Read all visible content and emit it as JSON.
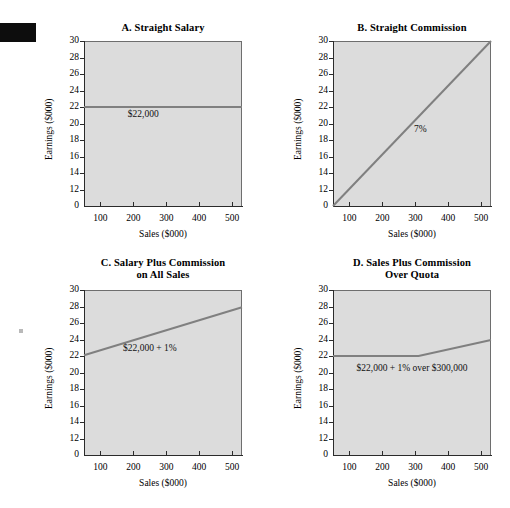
{
  "figure": {
    "background": "#ffffff",
    "plot_fill": "#dcdcdc",
    "line_color": "#808080",
    "axis_color": "#2b2b2b"
  },
  "chart_data": [
    {
      "type": "line",
      "panel": "A",
      "title": "A. Straight Salary",
      "title_line2": "",
      "xlabel": "Sales ($000)",
      "ylabel": "Earnings ($000)",
      "xlim": [
        50,
        530
      ],
      "ylim": [
        10,
        30
      ],
      "xticks": [
        100,
        200,
        300,
        400,
        500
      ],
      "yticks": [
        30,
        28,
        26,
        24,
        22,
        20,
        18,
        16,
        14,
        12,
        0
      ],
      "grid": false,
      "legend": "none",
      "series": [
        {
          "name": "Straight salary",
          "x": [
            50,
            530
          ],
          "values": [
            22,
            22
          ]
        }
      ],
      "annotations": [
        {
          "text": "$22,000",
          "x": 230,
          "y": 21.2
        }
      ]
    },
    {
      "type": "line",
      "panel": "B",
      "title": "B. Straight Commission",
      "title_line2": "",
      "xlabel": "Sales ($000)",
      "ylabel": "Earnings ($000)",
      "xlim": [
        50,
        530
      ],
      "ylim": [
        10,
        30
      ],
      "xticks": [
        100,
        200,
        300,
        400,
        500
      ],
      "yticks": [
        30,
        28,
        26,
        24,
        22,
        20,
        18,
        16,
        14,
        12,
        0
      ],
      "grid": false,
      "legend": "none",
      "series": [
        {
          "name": "7% commission",
          "x": [
            50,
            530
          ],
          "values": [
            10,
            30
          ]
        }
      ],
      "annotations": [
        {
          "text": "7%",
          "x": 315,
          "y": 19.3
        }
      ]
    },
    {
      "type": "line",
      "panel": "C",
      "title": "C. Salary Plus Commission",
      "title_line2": "on All Sales",
      "xlabel": "Sales ($000)",
      "ylabel": "Earnings ($000)",
      "xlim": [
        50,
        530
      ],
      "ylim": [
        10,
        30
      ],
      "xticks": [
        100,
        200,
        300,
        400,
        500
      ],
      "yticks": [
        30,
        28,
        26,
        24,
        22,
        20,
        18,
        16,
        14,
        12,
        0
      ],
      "grid": false,
      "legend": "none",
      "series": [
        {
          "name": "$22,000 plus 1% on all sales",
          "x": [
            50,
            530
          ],
          "values": [
            22.1,
            27.9
          ]
        }
      ],
      "annotations": [
        {
          "text": "$22,000 + 1%",
          "x": 250,
          "y": 23.0
        }
      ]
    },
    {
      "type": "line",
      "panel": "D",
      "title": "D. Sales Plus Commission",
      "title_line2": "Over Quota",
      "xlabel": "Sales ($000)",
      "ylabel": "Earnings ($000)",
      "xlim": [
        50,
        530
      ],
      "ylim": [
        10,
        30
      ],
      "xticks": [
        100,
        200,
        300,
        400,
        500
      ],
      "yticks": [
        30,
        28,
        26,
        24,
        22,
        20,
        18,
        16,
        14,
        12,
        0
      ],
      "grid": false,
      "legend": "none",
      "series": [
        {
          "name": "$22,000 plus 1% over $300,000",
          "x": [
            50,
            310,
            530
          ],
          "values": [
            22,
            22,
            23.95
          ]
        }
      ],
      "annotations": [
        {
          "text": "$22,000 + 1% over $300,000",
          "x": 290,
          "y": 20.6
        }
      ]
    }
  ]
}
